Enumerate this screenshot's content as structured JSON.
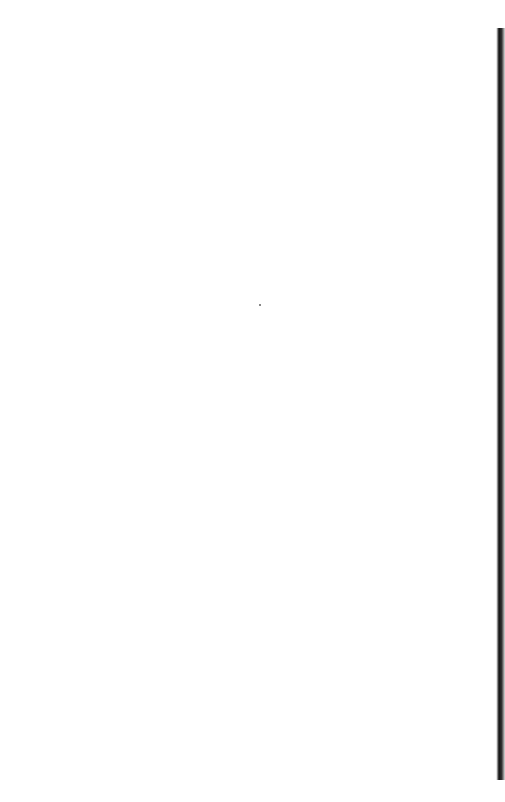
{
  "page": {
    "border_style": "matchsticks",
    "colors": {
      "background": "#ffffff",
      "ink": "#222222",
      "right_edge_dark": "#111111"
    }
  },
  "border": {
    "top_matches": [
      {
        "x": 45,
        "y": 30,
        "length": 100,
        "head": "right"
      },
      {
        "x": 162,
        "y": 30,
        "length": 100,
        "head": "right"
      },
      {
        "x": 280,
        "y": 30,
        "length": 100,
        "head": "right"
      },
      {
        "x": 389,
        "y": 30,
        "length": 100,
        "head": "right"
      }
    ],
    "left_matches": [
      {
        "x": 24,
        "y": 30,
        "length": 104,
        "head": "top"
      },
      {
        "x": 24,
        "y": 137,
        "length": 104,
        "head": "top"
      },
      {
        "x": 24,
        "y": 243,
        "length": 104,
        "head": "top"
      },
      {
        "x": 24,
        "y": 349,
        "length": 104,
        "head": "top"
      },
      {
        "x": 24,
        "y": 455,
        "length": 104,
        "head": "top"
      },
      {
        "x": 24,
        "y": 561,
        "length": 104,
        "head": "top"
      },
      {
        "x": 24,
        "y": 667,
        "length": 104,
        "head": "top"
      }
    ],
    "bottom_matches": [
      {
        "x": 44,
        "y": 758,
        "length": 100,
        "head": "left"
      },
      {
        "x": 153,
        "y": 758,
        "length": 100,
        "head": "left"
      },
      {
        "x": 268,
        "y": 758,
        "length": 100,
        "head": "left"
      },
      {
        "x": 385,
        "y": 758,
        "length": 100,
        "head": "left"
      }
    ],
    "right_bumps_y": [
      112,
      220,
      327,
      432,
      538,
      644,
      752
    ]
  },
  "icons": {
    "match": "matchstick-icon"
  }
}
